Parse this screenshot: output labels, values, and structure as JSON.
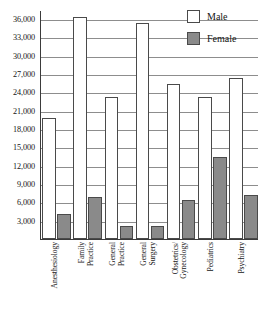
{
  "chart_data": {
    "type": "bar",
    "title": "",
    "xlabel": "",
    "ylabel": "",
    "ylim": [
      0,
      37500
    ],
    "ytick_step": 3000,
    "grid": true,
    "legend_position": "top-right",
    "categories": [
      "Anesthesiology",
      "Family Practice",
      "General Practice",
      "General Surgery",
      "Obstetrics/ Gynecology",
      "Pediatrics",
      "Psychiatry"
    ],
    "category_lines": [
      [
        "Anesthesiology"
      ],
      [
        "Family",
        "Practice"
      ],
      [
        "General",
        "Practice"
      ],
      [
        "General",
        "Surgery"
      ],
      [
        "Obstetrics/",
        "Gynecology"
      ],
      [
        "Pediatrics"
      ],
      [
        "Psychiatry"
      ]
    ],
    "series": [
      {
        "name": "Male",
        "color": "#ffffff",
        "values": [
          19800,
          36400,
          23300,
          35300,
          25400,
          23200,
          26300
        ]
      },
      {
        "name": "Female",
        "color": "#8a8a8a",
        "values": [
          4100,
          6900,
          2200,
          2200,
          6400,
          13400,
          7200
        ]
      }
    ],
    "ytick_labels": [
      "3,000",
      "6,000",
      "9,000",
      "12,000",
      "15,000",
      "18,000",
      "21,000",
      "24,000",
      "27,000",
      "30,000",
      "33,000",
      "36,000"
    ],
    "ytick_values": [
      3000,
      6000,
      9000,
      12000,
      15000,
      18000,
      21000,
      24000,
      27000,
      30000,
      33000,
      36000
    ]
  },
  "legend": {
    "entries": [
      {
        "label": "Male",
        "swatch": "male"
      },
      {
        "label": "Female",
        "swatch": "female"
      }
    ]
  }
}
